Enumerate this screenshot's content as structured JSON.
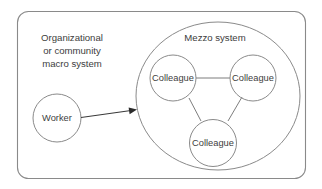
{
  "diagram": {
    "type": "nested-systems-diagram",
    "background_color": "#ffffff",
    "stroke_color": "#8a8a8a",
    "text_color": "#3d3d3d",
    "macro_system": {
      "label_line1": "Organizational",
      "label_line2": "or community",
      "label_line3": "macro system"
    },
    "mezzo_system": {
      "label": "Mezzo system"
    },
    "worker": {
      "label": "Worker"
    },
    "colleagues": {
      "top_left": "Colleague",
      "top_right": "Colleague",
      "bottom": "Colleague"
    }
  }
}
